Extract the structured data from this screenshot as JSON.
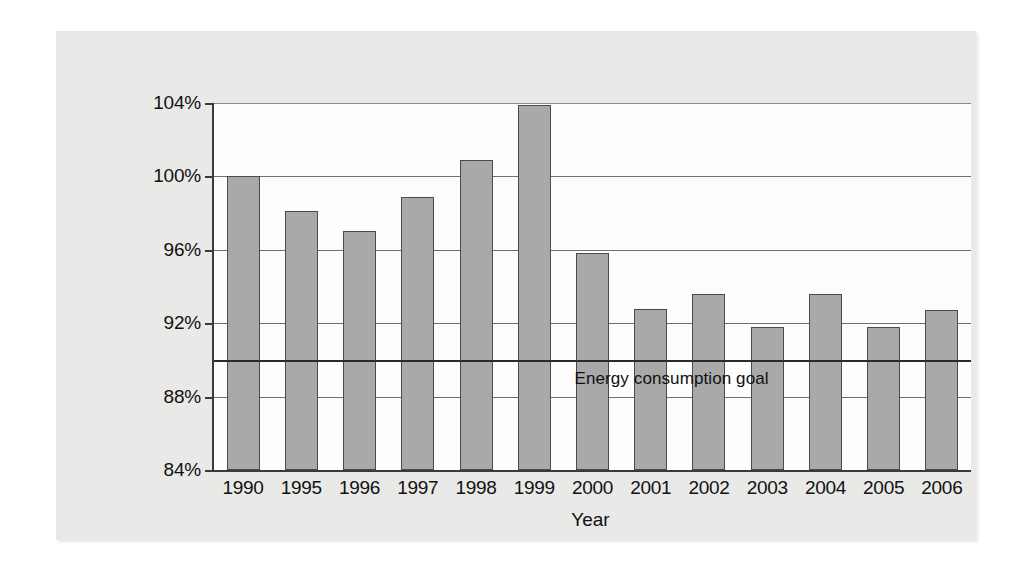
{
  "chart_data": {
    "type": "bar",
    "title": "",
    "xlabel": "Year",
    "ylabel": "",
    "categories": [
      "1990",
      "1995",
      "1996",
      "1997",
      "1998",
      "1999",
      "2000",
      "2001",
      "2002",
      "2003",
      "2004",
      "2005",
      "2006"
    ],
    "values": [
      100.0,
      98.1,
      97.0,
      98.9,
      100.9,
      103.9,
      95.8,
      92.8,
      93.6,
      91.8,
      93.6,
      91.8,
      92.7
    ],
    "ylim": [
      84,
      104
    ],
    "ytick_values": [
      84,
      88,
      92,
      96,
      100,
      104
    ],
    "ytick_labels": [
      "84%",
      "88%",
      "92%",
      "96%",
      "100%",
      "104%"
    ],
    "grid": true,
    "legend": "none",
    "annotations": [
      {
        "name": "energy-consumption-goal",
        "label": "Energy consumption goal",
        "type": "hline",
        "value": 90,
        "label_x_category": "2000"
      }
    ],
    "series": [
      {
        "name": "Energy consumption (% of baseline)",
        "values": [
          100.0,
          98.1,
          97.0,
          98.9,
          100.9,
          103.9,
          95.8,
          92.8,
          93.6,
          91.8,
          93.6,
          91.8,
          92.7
        ]
      }
    ],
    "colors": {
      "bar_fill": "#a9a9a9",
      "bar_border": "#4a4a4a",
      "axis": "#3a3a3a",
      "gridline": "#6f6f6f",
      "goal_line": "#2b2b2b",
      "panel_background": "#e9e9e8",
      "plot_background": "#fdfdfd"
    }
  }
}
